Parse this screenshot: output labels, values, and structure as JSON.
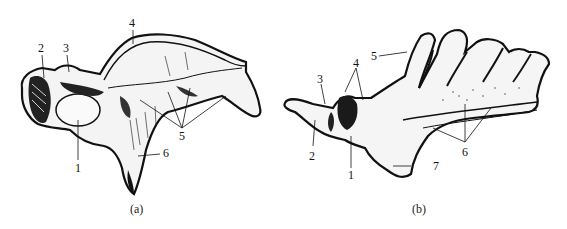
{
  "figure_a": {
    "caption": "(a)",
    "labels": [
      "1",
      "2",
      "3",
      "4",
      "5",
      "6"
    ]
  },
  "figure_b": {
    "caption": "(b)",
    "labels": [
      "1",
      "2",
      "3",
      "4",
      "5",
      "6",
      "7"
    ]
  },
  "colors": {
    "ink": "#111111",
    "background": "#ffffff"
  }
}
